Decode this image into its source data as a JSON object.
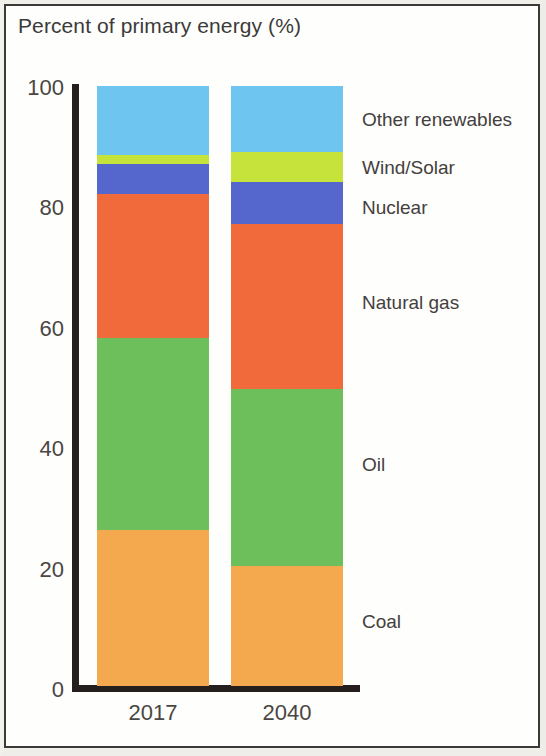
{
  "chart_data": {
    "type": "bar",
    "stacked": true,
    "title": "Percent of primary energy (%)",
    "xlabel": "",
    "ylabel": "",
    "ylim": [
      0,
      100
    ],
    "yticks": [
      0,
      20,
      40,
      60,
      80,
      100
    ],
    "ytick_labels": [
      "0",
      "20",
      "40",
      "60",
      "80",
      "100"
    ],
    "grid": false,
    "legend_position": "right (direct labels)",
    "categories": [
      "2017",
      "2040"
    ],
    "series": [
      {
        "name": "Coal",
        "color": "#F5A94E",
        "values": [
          26.0,
          20.0
        ]
      },
      {
        "name": "Oil",
        "color": "#6CBF5A",
        "values": [
          32.0,
          29.5
        ]
      },
      {
        "name": "Natural gas",
        "color": "#F06A3C",
        "values": [
          24.0,
          27.5
        ]
      },
      {
        "name": "Nuclear",
        "color": "#5566CC",
        "values": [
          5.0,
          7.0
        ]
      },
      {
        "name": "Wind/Solar",
        "color": "#C6E33C",
        "values": [
          1.5,
          5.0
        ]
      },
      {
        "name": "Other renewables",
        "color": "#6EC6F0",
        "values": [
          11.5,
          11.0
        ]
      }
    ]
  },
  "labels": {
    "title": "Percent of primary energy (%)",
    "legend": [
      {
        "text": "Other renewables",
        "y": 120
      },
      {
        "text": "Wind/Solar",
        "y": 168
      },
      {
        "text": "Nuclear",
        "y": 208
      },
      {
        "text": "Natural gas",
        "y": 303
      },
      {
        "text": "Oil",
        "y": 465
      },
      {
        "text": "Coal",
        "y": 622
      }
    ],
    "yticks": [
      {
        "text": "100",
        "y": 88
      },
      {
        "text": "80",
        "y": 208
      },
      {
        "text": "60",
        "y": 329
      },
      {
        "text": "40",
        "y": 449
      },
      {
        "text": "20",
        "y": 570
      },
      {
        "text": "0",
        "y": 690
      }
    ],
    "xticks": [
      "2017",
      "2040"
    ]
  }
}
